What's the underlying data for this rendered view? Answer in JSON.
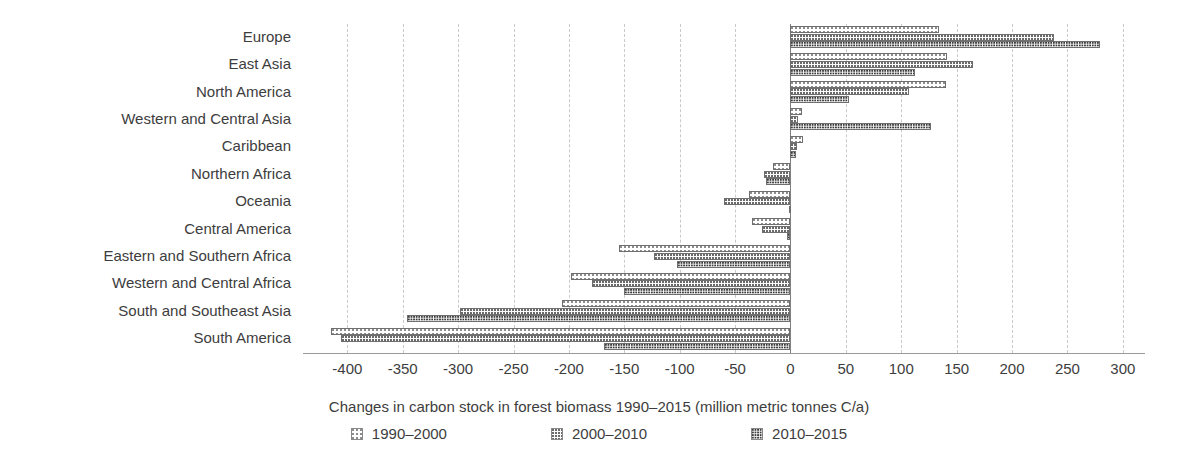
{
  "chart_data": {
    "type": "bar",
    "orientation": "horizontal",
    "title": "",
    "xlabel": "Changes in carbon stock in forest biomass 1990–2015 (million metric tonnes C/a)",
    "ylabel": "",
    "xlim": [
      -440,
      320
    ],
    "xticks": [
      -400,
      -350,
      -300,
      -250,
      -200,
      -150,
      -100,
      -50,
      0,
      50,
      100,
      150,
      200,
      250,
      300
    ],
    "xtick_labels": [
      "-400",
      "-350",
      "-300",
      "-250",
      "-200",
      "-150",
      "-100",
      "-50",
      "0",
      "50",
      "100",
      "150",
      "200",
      "250",
      "300"
    ],
    "grid": "vertical-dashed",
    "legend_position": "bottom-center",
    "categories": [
      "Europe",
      "East Asia",
      "North America",
      "Western and Central Asia",
      "Caribbean",
      "Northern Africa",
      "Oceania",
      "Central America",
      "Eastern and Southern Africa",
      "Western and Central Africa",
      "South and Southeast Asia",
      "South America"
    ],
    "series": [
      {
        "name": "1990–2000",
        "pattern": "light-dots",
        "values": [
          134,
          141,
          140,
          10,
          11,
          -16,
          -37,
          -35,
          -155,
          -198,
          -206,
          -415
        ]
      },
      {
        "name": "2000–2010",
        "pattern": "medium-dots",
        "values": [
          238,
          165,
          107,
          7,
          6,
          -24,
          -60,
          -26,
          -123,
          -179,
          -298,
          -406
        ]
      },
      {
        "name": "2010–2015",
        "pattern": "dense-dots",
        "values": [
          279,
          112,
          53,
          127,
          5,
          -22,
          -1,
          -3,
          -102,
          -150,
          -346,
          -168
        ]
      }
    ]
  },
  "legend": {
    "items": [
      {
        "label": "1990–2000"
      },
      {
        "label": "2000–2010"
      },
      {
        "label": "2010–2015"
      }
    ]
  }
}
